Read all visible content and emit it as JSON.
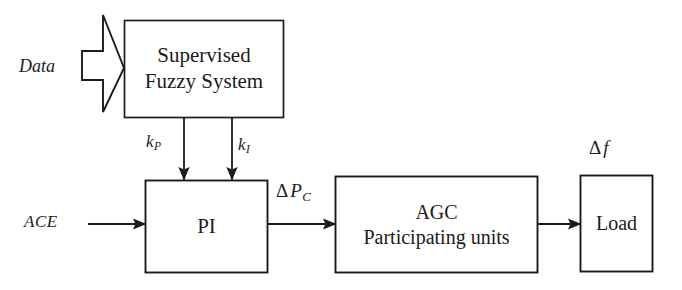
{
  "diagram": {
    "stroke_color": "#1b1b1b",
    "background_color": "#ffffff",
    "blocks": [
      {
        "id": "fuzzy",
        "name": "supervised-fuzzy-system-block",
        "line1": "Supervised",
        "line2": "Fuzzy System",
        "x": 124,
        "y": 20,
        "w": 160,
        "h": 98
      },
      {
        "id": "pi",
        "name": "pi-controller-block",
        "line1": "PI",
        "line2": "",
        "x": 145,
        "y": 180,
        "w": 123,
        "h": 93
      },
      {
        "id": "agc",
        "name": "agc-participating-units-block",
        "line1": "AGC",
        "line2": "Participating units",
        "x": 335,
        "y": 176,
        "w": 203,
        "h": 97
      },
      {
        "id": "load",
        "name": "load-block",
        "line1": "Load",
        "line2": "",
        "x": 580,
        "y": 175,
        "w": 73,
        "h": 97
      }
    ],
    "signals": {
      "data": "Data",
      "ace": "ACE",
      "kp_base": "k",
      "kp_sub": "P",
      "ki_base": "k",
      "ki_sub": "I",
      "delta": "Δ",
      "dpc_base": "P",
      "dpc_sub": "C",
      "df_base": "f"
    }
  }
}
